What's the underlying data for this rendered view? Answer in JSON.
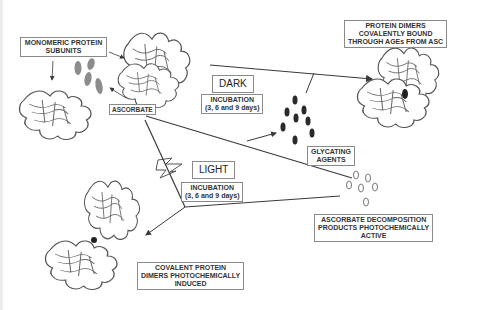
{
  "diagram": {
    "labels": {
      "monomeric": {
        "line1": "MONOMERIC PROTEIN",
        "line2": "SUBUNITS"
      },
      "ascorbate": "ASCORBATE",
      "dark": "DARK",
      "dark_incubation": {
        "line1": "INCUBATION",
        "line2": "(3, 6  and 9 days)"
      },
      "light": "LIGHT",
      "light_incubation": {
        "line1": "INCUBATION",
        "line2": "(3, 6  and 9 days)"
      },
      "dimers_ages": {
        "line1": "PROTEIN DIMERS",
        "line2": "COVALENTLY BOUND",
        "line3": "THROUGH AGEs FROM ASC"
      },
      "glycating": {
        "line1": "GLYCATING",
        "line2": "AGENTS"
      },
      "decomposition": {
        "line1": "ASCORBATE DECOMPOSITION",
        "line2": "PRODUCTS PHOTOCHEMICALLY",
        "line3": "ACTIVE"
      },
      "photo_dimers": {
        "line1": "COVALENT PROTEIN",
        "line2": "DIMERS PHOTOCHEMICALLY",
        "line3": "INDUCED"
      }
    },
    "icons": [
      "protein-structure-icon",
      "ascorbate-molecule-icon",
      "glycating-agent-icon",
      "decomposition-product-icon",
      "lightning-bolt-icon",
      "arrow-icon"
    ],
    "colors": {
      "line": "#3a3a3a",
      "box_border": "#8a8a8a",
      "ascorbate_fill": "#8c8c8c",
      "glycating_fill": "#2a2a2a",
      "protein_stroke": "#555555"
    }
  }
}
